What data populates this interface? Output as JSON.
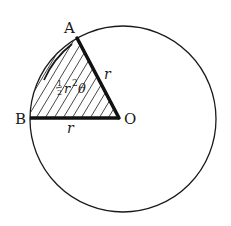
{
  "diagram": {
    "type": "circle-sector",
    "points": {
      "A": "A",
      "B": "B",
      "O": "O"
    },
    "radius_labels": {
      "OA": "r",
      "OB": "r"
    },
    "sector_area_label": {
      "fraction_numerator": "1",
      "fraction_denominator": "2",
      "variable": "r",
      "exponent": "2",
      "angle": "θ"
    },
    "colors": {
      "stroke": "#1a1a1a",
      "background": "#ffffff",
      "hatch": "#333333"
    }
  }
}
